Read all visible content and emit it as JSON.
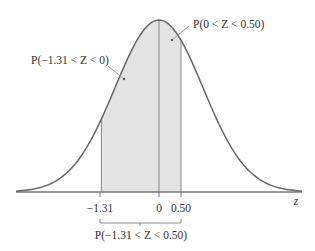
{
  "diagram": {
    "type": "standard-normal-curve",
    "axis_variable": "z",
    "tick_labels": [
      "-1.31",
      "0",
      "0.50"
    ],
    "tick_values": [
      -1.31,
      0,
      0.5
    ],
    "shaded_region": {
      "from": -1.31,
      "to": 0.5
    },
    "annotations": {
      "left_area": "P(−1.31 < Z < 0)",
      "right_area": "P(0 < Z < 0.50)",
      "total_area": "P(−1.31 < Z < 0.50)"
    },
    "labels": {
      "tick_neg131": "−1.31",
      "tick_zero": "0",
      "tick_050": "0.50",
      "axis_z": "z"
    },
    "colors": {
      "curve": "#666666",
      "shade": "#e3e3e3",
      "axis": "#777777",
      "text": "#333333"
    }
  }
}
